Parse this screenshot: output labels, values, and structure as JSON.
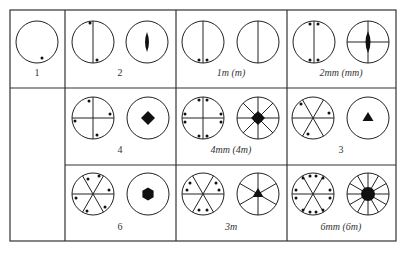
{
  "grid": {
    "rows": 3,
    "cols": 4
  },
  "cells": [
    {
      "label": "1",
      "label_pos": [
        37,
        72
      ]
    },
    {
      "label": "2",
      "label_pos": [
        120,
        72
      ]
    },
    {
      "label": "1m (m)",
      "label_pos": [
        231,
        72
      ]
    },
    {
      "label": "2mm (mm)",
      "label_pos": [
        341,
        72
      ]
    },
    {
      "label": "4",
      "label_pos": [
        120,
        149
      ]
    },
    {
      "label": "4mm (4m)",
      "label_pos": [
        231,
        149
      ]
    },
    {
      "label": "3",
      "label_pos": [
        341,
        149
      ]
    },
    {
      "label": "6",
      "label_pos": [
        120,
        226
      ]
    },
    {
      "label": "3m",
      "label_pos": [
        231,
        226
      ]
    },
    {
      "label": "6mm (6m)",
      "label_pos": [
        341,
        226
      ]
    }
  ],
  "colors": {
    "line": "#222222",
    "border": "#333333",
    "fill": "#111111"
  }
}
